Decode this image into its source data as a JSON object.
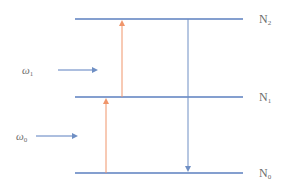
{
  "diagram": {
    "title": "",
    "colors": {
      "level_line": "#5b7fbf",
      "absorption_arrow": "#f0956a",
      "emission_arrow": "#6f8fc4",
      "incident_arrow": "#5b7fbf",
      "label": "#6b6b6b"
    },
    "levels": [
      {
        "id": "N2",
        "base": "N",
        "sub": "2",
        "y": 19
      },
      {
        "id": "N1",
        "base": "N",
        "sub": "1",
        "y": 97
      },
      {
        "id": "N0",
        "base": "N",
        "sub": "0",
        "y": 173
      }
    ],
    "transitions": [
      {
        "type": "absorption",
        "from": "N0",
        "to": "N1",
        "x": 106
      },
      {
        "type": "absorption",
        "from": "N1",
        "to": "N2",
        "x": 122
      },
      {
        "type": "emission",
        "from": "N2",
        "to": "N0",
        "x": 188
      }
    ],
    "incident_beams": [
      {
        "symbol": "ω",
        "sub": "1",
        "y": 70
      },
      {
        "symbol": "ω",
        "sub": "0",
        "y": 136
      }
    ]
  }
}
